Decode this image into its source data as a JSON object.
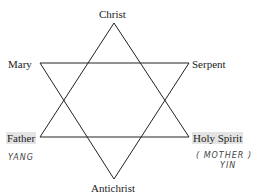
{
  "diagram": {
    "type": "hexagram",
    "nodes": {
      "top": "Christ",
      "upper_left": "Mary",
      "upper_right": "Serpent",
      "lower_left": "Father",
      "lower_right": "Holy Spirit",
      "bottom": "Antichrist"
    },
    "annotations": {
      "father_note": "YANG",
      "holy_spirit_note_line1": "( MOTHER )",
      "holy_spirit_note_line2": "YIN"
    },
    "edges": [
      [
        "Christ",
        "Father"
      ],
      [
        "Father",
        "Holy Spirit"
      ],
      [
        "Holy Spirit",
        "Christ"
      ],
      [
        "Mary",
        "Serpent"
      ],
      [
        "Serpent",
        "Antichrist"
      ],
      [
        "Antichrist",
        "Mary"
      ]
    ],
    "line_color": "#222222",
    "highlight_color": "#e4e4e4"
  }
}
